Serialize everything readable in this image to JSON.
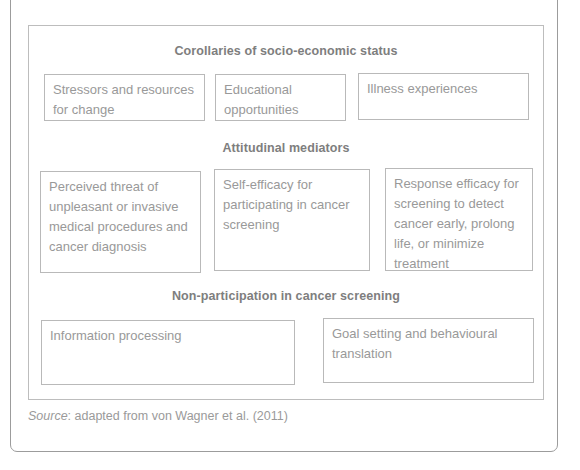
{
  "diagram": {
    "sections": [
      {
        "heading": "Corollaries of socio-economic status",
        "boxes": [
          "Stressors and resources for change",
          "Educational opportunities",
          "Illness experiences"
        ]
      },
      {
        "heading": "Attitudinal mediators",
        "boxes": [
          "Perceived threat of unpleasant or invasive medical procedures and cancer diagnosis",
          "Self-efficacy for participating in cancer screening",
          "Response efficacy for screening to detect cancer early, prolong life, or minimize treatment"
        ]
      },
      {
        "heading": "Non-participation in cancer screening",
        "boxes": [
          "Information processing",
          "Goal setting and behavioural translation"
        ]
      }
    ],
    "source": {
      "label": "Source",
      "separator": ": ",
      "text": "adapted from von Wagner et al. (2011)"
    }
  }
}
